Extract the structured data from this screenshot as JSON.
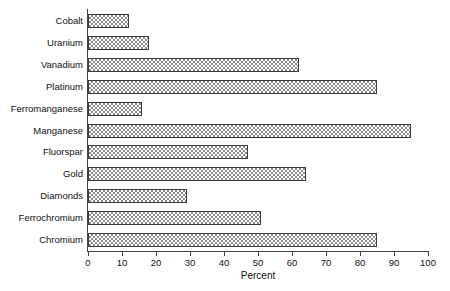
{
  "chart_data": {
    "type": "bar",
    "orientation": "horizontal",
    "title": "",
    "xlabel": "Percent",
    "ylabel": "",
    "xlim": [
      0,
      100
    ],
    "xticks": [
      0,
      10,
      20,
      30,
      40,
      50,
      60,
      70,
      80,
      90,
      100
    ],
    "grid": false,
    "legend": null,
    "categories": [
      "Cobalt",
      "Uranium",
      "Vanadium",
      "Platinum",
      "Ferromanganese",
      "Manganese",
      "Fluorspar",
      "Gold",
      "Diamonds",
      "Ferrochromium",
      "Chromium"
    ],
    "values": [
      12,
      18,
      62,
      85,
      16,
      95,
      47,
      64,
      29,
      51,
      85
    ],
    "bar_fill": "checkerboard-gray",
    "bar_edge_color": "#3b3b3b",
    "bar_fill_color": "#8c8c8c"
  },
  "axis": {
    "tick_labels": [
      "0",
      "10",
      "20",
      "30",
      "40",
      "50",
      "60",
      "70",
      "80",
      "90",
      "100"
    ],
    "x_title": "Percent"
  }
}
